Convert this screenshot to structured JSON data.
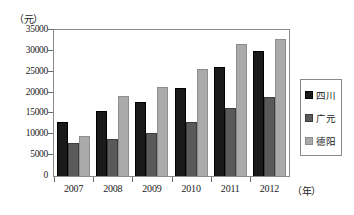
{
  "chart_data": {
    "type": "bar",
    "title": "",
    "subtitle": "",
    "xlabel": "年",
    "ylabel": "元",
    "y_unit_label": "（元）",
    "x_unit_label": "（年）",
    "categories": [
      "2007",
      "2008",
      "2009",
      "2010",
      "2011",
      "2012"
    ],
    "series": [
      {
        "name": "四川",
        "color": "#1a1a1a",
        "values": [
          13000,
          15500,
          17700,
          21200,
          26200,
          29900
        ]
      },
      {
        "name": "广元",
        "color": "#5a5a5a",
        "values": [
          8000,
          8800,
          10200,
          13000,
          16300,
          18900
        ]
      },
      {
        "name": "德阳",
        "color": "#aaaaaa",
        "values": [
          9500,
          19300,
          21400,
          25700,
          31700,
          32900
        ]
      }
    ],
    "ylim": [
      0,
      35000
    ],
    "ytick_step": 5000,
    "ytick_labels": [
      "0",
      "5000",
      "10000",
      "15000",
      "20000",
      "25000",
      "30000",
      "35000"
    ],
    "ytick_values": [
      0,
      5000,
      10000,
      15000,
      20000,
      25000,
      30000,
      35000
    ],
    "grid": false,
    "legend_position": "right",
    "frame": true
  }
}
